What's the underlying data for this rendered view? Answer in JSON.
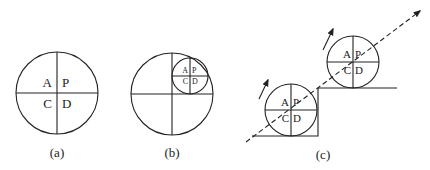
{
  "figure": {
    "panels": [
      {
        "id": "a",
        "caption": "(a)",
        "quadrants": {
          "top_left": "A",
          "top_right": "P",
          "bottom_left": "C",
          "bottom_right": "D"
        }
      },
      {
        "id": "b",
        "caption": "(b)",
        "inner_quadrants": {
          "top_left": "A",
          "top_right": "P",
          "bottom_left": "C",
          "bottom_right": "D"
        }
      },
      {
        "id": "c",
        "caption": "(c)",
        "lower_circle": {
          "top_left": "A",
          "top_right": "P",
          "bottom_left": "C",
          "bottom_right": "D"
        },
        "upper_circle": {
          "top_left": "A",
          "top_right": "P",
          "bottom_left": "C",
          "bottom_right": "D"
        }
      }
    ],
    "colors": {
      "line": "#222222",
      "background": "#ffffff"
    }
  }
}
